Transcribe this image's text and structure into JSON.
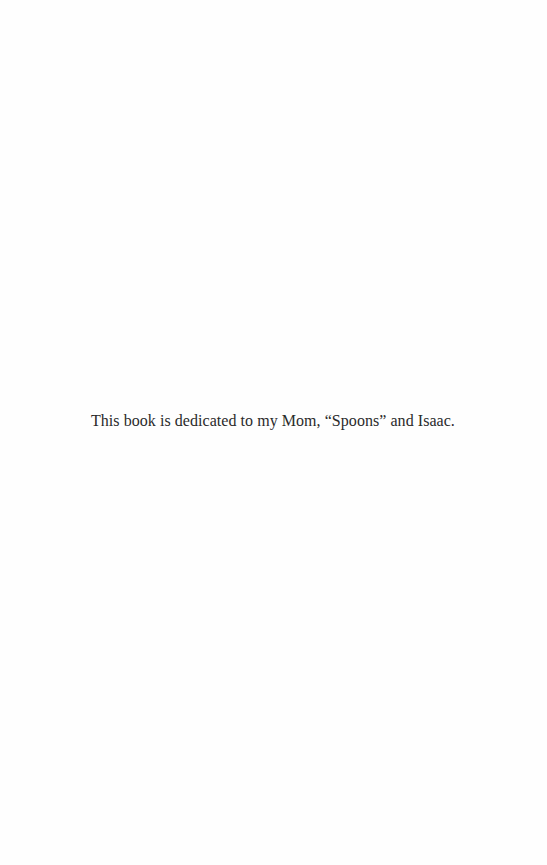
{
  "page": {
    "dedication": "This book is dedicated to my Mom, “Spoons” and Isaac."
  }
}
